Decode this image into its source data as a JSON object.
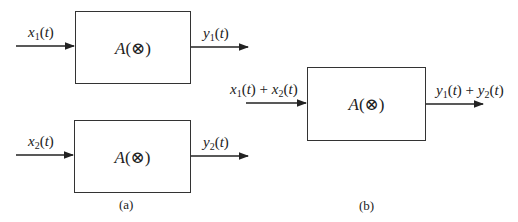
{
  "diagram": {
    "type": "block-diagram",
    "panel_a": {
      "caption": "(a)",
      "blocks": [
        {
          "operator": "A",
          "argument": "⊗",
          "input": {
            "var": "x",
            "sub": "1",
            "arg": "t"
          },
          "output": {
            "var": "y",
            "sub": "1",
            "arg": "t"
          }
        },
        {
          "operator": "A",
          "argument": "⊗",
          "input": {
            "var": "x",
            "sub": "2",
            "arg": "t"
          },
          "output": {
            "var": "y",
            "sub": "2",
            "arg": "t"
          }
        }
      ]
    },
    "panel_b": {
      "caption": "(b)",
      "block": {
        "operator": "A",
        "argument": "⊗",
        "input_terms": [
          {
            "var": "x",
            "sub": "1",
            "arg": "t"
          },
          {
            "var": "x",
            "sub": "2",
            "arg": "t"
          }
        ],
        "output_terms": [
          {
            "var": "y",
            "sub": "1",
            "arg": "t"
          },
          {
            "var": "y",
            "sub": "2",
            "arg": "t"
          }
        ],
        "plus": "+"
      }
    },
    "stroke_color": "#333333"
  }
}
